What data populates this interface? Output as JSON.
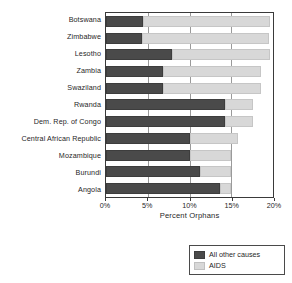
{
  "chart_data": {
    "type": "bar",
    "orientation": "horizontal",
    "stacked": true,
    "title": "",
    "xlabel": "Percent Orphans",
    "ylabel": "",
    "xlim": [
      0,
      20
    ],
    "xtick_labels": [
      "0%",
      "5%",
      "10%",
      "15%",
      "20%"
    ],
    "xtick_values": [
      0,
      5,
      10,
      15,
      20
    ],
    "grid": true,
    "grid_axis": "x",
    "legend_position": "bottom-right",
    "categories": [
      "Botswana",
      "Zimbabwe",
      "Lesotho",
      "Zambia",
      "Swaziland",
      "Rwanda",
      "Dem. Rep. of Congo",
      "Central African Republic",
      "Mozambique",
      "Burundi",
      "Angola"
    ],
    "series": [
      {
        "name": "All other causes",
        "color": "#4a4a4a",
        "values": [
          4.4,
          4.3,
          7.9,
          6.8,
          6.8,
          14.2,
          14.2,
          10.0,
          10.0,
          11.2,
          13.6
        ]
      },
      {
        "name": "AIDS",
        "color": "#d8d8d8",
        "values": [
          15.2,
          15.2,
          11.8,
          11.8,
          11.8,
          3.4,
          3.4,
          5.8,
          5.0,
          3.8,
          1.4
        ]
      }
    ],
    "totals": [
      19.6,
      19.5,
      19.7,
      18.6,
      18.6,
      17.6,
      17.6,
      15.8,
      15.0,
      15.0,
      15.0
    ]
  },
  "legend": {
    "entries": [
      {
        "label": "All other causes",
        "swatch": "dark-gray-swatch"
      },
      {
        "label": "AIDS",
        "swatch": "light-gray-swatch"
      }
    ]
  },
  "colors": {
    "all_other_causes": "#4a4a4a",
    "aids": "#d8d8d8",
    "axis": "#3a3a3a",
    "gridline": "#9a9a9a",
    "text": "#1f1f1f",
    "background": "#ffffff"
  }
}
